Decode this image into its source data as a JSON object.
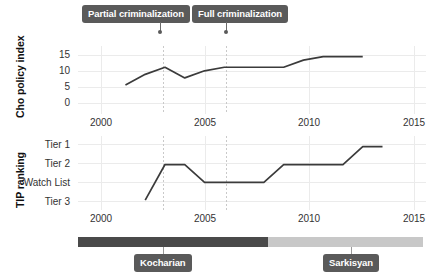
{
  "figure": {
    "background": "#ffffff",
    "line_color": "#3b3b3b",
    "callout_color": "#5a5a5a",
    "grid_color": "#ebebeb"
  },
  "annotations": [
    {
      "label": "Partial criminalization",
      "year": 2003
    },
    {
      "label": "Full criminalization",
      "year": 2006
    }
  ],
  "presidency": {
    "segments": [
      {
        "label": "Kocharian",
        "start": 1998,
        "end": 2008,
        "color": "#4a4a4a"
      },
      {
        "label": "Sarkisyan",
        "start": 2008,
        "end": 2016,
        "color": "#c8c8c8"
      }
    ],
    "marker_years": [
      2003,
      2012
    ]
  },
  "chart_data": [
    {
      "type": "line",
      "title": "",
      "xlabel": "",
      "ylabel": "Cho policy index",
      "xlim": [
        1998.6,
        2016.2
      ],
      "ylim": [
        -2.2,
        17.0
      ],
      "xticks": [
        2000,
        2005,
        2010,
        2015
      ],
      "xticklabels": [
        "2000",
        "2005",
        "2010",
        "2015"
      ],
      "yticks": [
        0,
        5,
        10,
        15
      ],
      "yticklabels": [
        "0",
        "5",
        "10",
        "15"
      ],
      "grid": true,
      "legend": "none",
      "x": [
        2001,
        2002,
        2003,
        2004,
        2005,
        2006,
        2007,
        2008,
        2009,
        2010,
        2011,
        2012,
        2013
      ],
      "values": [
        6,
        9,
        11,
        8,
        10,
        11,
        11,
        11,
        11,
        13,
        14,
        14,
        14
      ],
      "series": [
        {
          "name": "Cho policy index",
          "values": [
            6,
            9,
            11,
            8,
            10,
            11,
            11,
            11,
            11,
            13,
            14,
            14,
            14
          ]
        }
      ]
    },
    {
      "type": "line",
      "title": "",
      "xlabel": "",
      "ylabel": "TIP ranking",
      "xlim": [
        1998.6,
        2016.2
      ],
      "ylim": [
        -0.55,
        3.6
      ],
      "xticks": [
        2000,
        2005,
        2010,
        2015
      ],
      "xticklabels": [
        "2000",
        "2005",
        "2010",
        "2015"
      ],
      "yticks": [
        0,
        1,
        2,
        3
      ],
      "yticklabels": [
        "Tier 3",
        "Watch List",
        "Tier 2",
        "Tier 1"
      ],
      "grid": true,
      "legend": "none",
      "x": [
        2002,
        2003,
        2004,
        2005,
        2006,
        2007,
        2008,
        2009,
        2010,
        2011,
        2012,
        2013,
        2014
      ],
      "values": [
        0,
        2,
        2,
        1,
        1,
        1,
        1,
        2,
        2,
        2,
        2,
        3,
        3
      ],
      "series": [
        {
          "name": "TIP ranking",
          "values": [
            0,
            2,
            2,
            1,
            1,
            1,
            1,
            2,
            2,
            2,
            2,
            3,
            3
          ]
        }
      ]
    }
  ]
}
